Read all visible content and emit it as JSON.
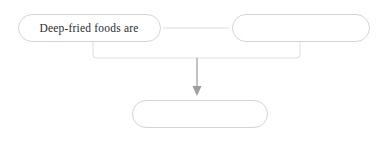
{
  "diagram": {
    "type": "flowchart",
    "orientation": "top-down",
    "theme": {
      "background": "#ffffff",
      "node_border": "#d2d2d2",
      "node_fill": "#ffffff",
      "connector": "#d8d8d8",
      "arrow": "#9a9a9a",
      "text": "#2b2b2b"
    },
    "nodes": [
      {
        "id": "node-1",
        "label": "Deep-fried foods are",
        "shape": "rounded-rectangle",
        "row": "top",
        "position": "left"
      },
      {
        "id": "node-2",
        "label": "",
        "shape": "rounded-rectangle",
        "row": "top",
        "position": "right"
      },
      {
        "id": "node-3",
        "label": "",
        "shape": "rounded-rectangle",
        "row": "bottom",
        "position": "center"
      }
    ],
    "connectors": [
      {
        "id": "connector-horizontal",
        "from": "node-1",
        "to": "node-2",
        "style": "line",
        "arrowhead": "none"
      },
      {
        "id": "connector-bracket",
        "from": "node-1,node-2",
        "to": "node-3",
        "style": "bracket",
        "arrowhead": "none"
      },
      {
        "id": "connector-arrow",
        "from": "bracket",
        "to": "node-3",
        "style": "line",
        "arrowhead": "triangle-down"
      }
    ]
  }
}
